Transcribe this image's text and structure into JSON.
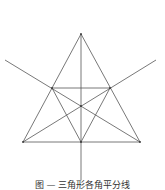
{
  "figure": {
    "caption": "图 — 三角形各角平分线",
    "stroke_color": "#555555",
    "points": {
      "A_apex": [
        81,
        34
      ],
      "B_bottom_left": [
        23,
        142
      ],
      "C_bottom_right": [
        140,
        142
      ],
      "D_mid_bottom": [
        81,
        142
      ],
      "E_mid_left": [
        52,
        88
      ],
      "F_mid_right": [
        110,
        88
      ],
      "G_center": [
        81,
        106
      ]
    }
  }
}
